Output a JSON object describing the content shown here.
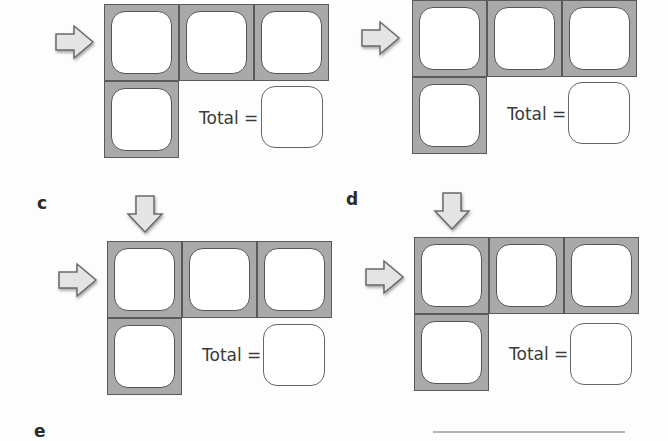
{
  "worksheet": {
    "colors": {
      "cell_fill": "#a9a9a9",
      "cell_border": "#5a5a5a",
      "slot_fill": "#ffffff",
      "arrow_fill": "#e4e4e4",
      "arrow_outline": "#6a6a6a"
    },
    "problems": [
      {
        "id": "a",
        "label": "",
        "arrows": [
          "right"
        ],
        "total_label": "Total =",
        "total_value": "",
        "slots": [
          "",
          "",
          "",
          ""
        ]
      },
      {
        "id": "b",
        "label": "",
        "arrows": [
          "right"
        ],
        "total_label": "Total =",
        "total_value": "",
        "slots": [
          "",
          "",
          "",
          ""
        ]
      },
      {
        "id": "c",
        "label": "c",
        "arrows": [
          "down",
          "right"
        ],
        "total_label": "Total =",
        "total_value": "",
        "slots": [
          "",
          "",
          "",
          ""
        ]
      },
      {
        "id": "d",
        "label": "d",
        "arrows": [
          "down",
          "right"
        ],
        "total_label": "Total =",
        "total_value": "",
        "slots": [
          "",
          "",
          "",
          ""
        ]
      }
    ],
    "next_label": "e"
  }
}
